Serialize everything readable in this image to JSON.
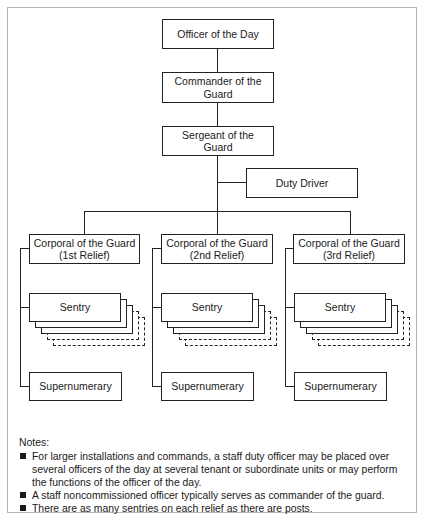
{
  "diagram": {
    "type": "organization-chart",
    "nodes": {
      "officer_of_day": "Officer of the Day",
      "commander": [
        "Commander of the",
        "Guard"
      ],
      "sergeant": [
        "Sergeant of the",
        "Guard"
      ],
      "duty_driver": "Duty Driver",
      "reliefs": [
        {
          "corporal": [
            "Corporal of the Guard",
            "(1st Relief)"
          ],
          "sentry": "Sentry",
          "supernumerary": "Supernumerary"
        },
        {
          "corporal": [
            "Corporal of the Guard",
            "(2nd Relief)"
          ],
          "sentry": "Sentry",
          "supernumerary": "Supernumerary"
        },
        {
          "corporal": [
            "Corporal of the Guard",
            "(3rd Relief)"
          ],
          "sentry": "Sentry",
          "supernumerary": "Supernumerary"
        }
      ]
    },
    "edges": [
      [
        "Officer of the Day",
        "Commander of the Guard"
      ],
      [
        "Commander of the Guard",
        "Sergeant of the Guard"
      ],
      [
        "Sergeant of the Guard",
        "Duty Driver"
      ],
      [
        "Sergeant of the Guard",
        "Corporal of the Guard (1st Relief)"
      ],
      [
        "Sergeant of the Guard",
        "Corporal of the Guard (2nd Relief)"
      ],
      [
        "Sergeant of the Guard",
        "Corporal of the Guard (3rd Relief)"
      ],
      [
        "Corporal of the Guard (1st Relief)",
        "Sentry"
      ],
      [
        "Corporal of the Guard (1st Relief)",
        "Supernumerary"
      ],
      [
        "Corporal of the Guard (2nd Relief)",
        "Sentry"
      ],
      [
        "Corporal of the Guard (2nd Relief)",
        "Supernumerary"
      ],
      [
        "Corporal of the Guard (3rd Relief)",
        "Sentry"
      ],
      [
        "Corporal of the Guard (3rd Relief)",
        "Supernumerary"
      ]
    ]
  },
  "notes": {
    "title": "Notes:",
    "items": [
      "For larger installations and commands, a staff duty officer may be placed over several officers of the day at several tenant or subordinate units or may perform the functions of the officer of the day.",
      "A staff noncommissioned officer typically serves as commander of the guard.",
      "There are as many sentries on each relief as there are posts."
    ]
  },
  "colors": {
    "line": "#222222",
    "frame_border": "#b5b5b5",
    "background": "#ffffff"
  }
}
